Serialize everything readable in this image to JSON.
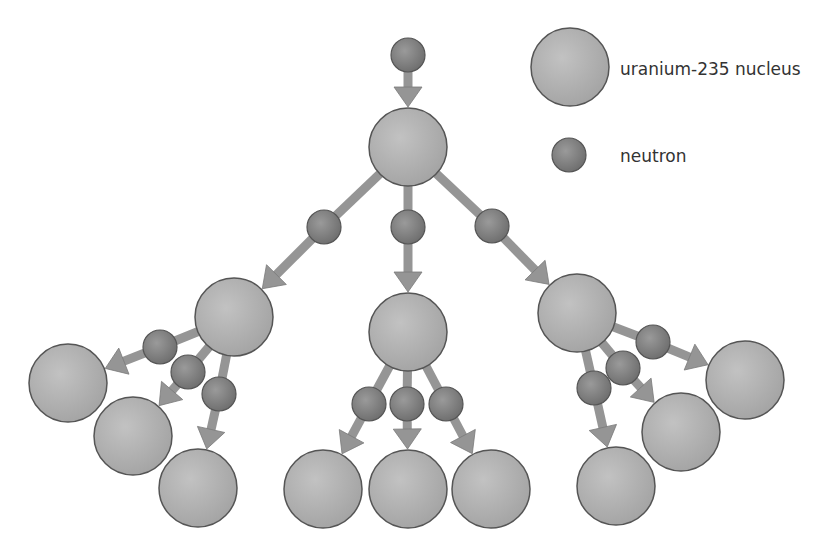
{
  "diagram": {
    "colors": {
      "nucleus_fill": "#a4a4a4",
      "nucleus_highlight": "#c2c2c2",
      "neutron_fill": "#7e7e7e",
      "neutron_highlight": "#9a9a9a",
      "stroke": "#555555",
      "arrow": "#959595"
    },
    "nucleus_radius": 39,
    "neutron_radius": 17,
    "nuclei": [
      {
        "id": "n0",
        "x": 408,
        "y": 147
      },
      {
        "id": "n1a",
        "x": 234,
        "y": 317
      },
      {
        "id": "n1b",
        "x": 408,
        "y": 332
      },
      {
        "id": "n1c",
        "x": 577,
        "y": 313
      },
      {
        "id": "n2a",
        "x": 68,
        "y": 383
      },
      {
        "id": "n2b",
        "x": 133,
        "y": 436
      },
      {
        "id": "n2c",
        "x": 198,
        "y": 488
      },
      {
        "id": "n2d",
        "x": 323,
        "y": 489
      },
      {
        "id": "n2e",
        "x": 408,
        "y": 489
      },
      {
        "id": "n2f",
        "x": 491,
        "y": 489
      },
      {
        "id": "n2g",
        "x": 616,
        "y": 486
      },
      {
        "id": "n2h",
        "x": 681,
        "y": 432
      },
      {
        "id": "n2i",
        "x": 745,
        "y": 380
      }
    ],
    "neutrons": [
      {
        "from": null,
        "x": 408,
        "y": 55,
        "to": "n0"
      },
      {
        "from": "n0",
        "x": 324,
        "y": 227,
        "to": "n1a"
      },
      {
        "from": "n0",
        "x": 408,
        "y": 227,
        "to": "n1b"
      },
      {
        "from": "n0",
        "x": 492,
        "y": 226,
        "to": "n1c"
      },
      {
        "from": "n1a",
        "x": 160,
        "y": 347,
        "to": "n2a"
      },
      {
        "from": "n1a",
        "x": 188,
        "y": 372,
        "to": "n2b"
      },
      {
        "from": "n1a",
        "x": 219,
        "y": 394,
        "to": "n2c"
      },
      {
        "from": "n1b",
        "x": 369,
        "y": 404,
        "to": "n2d"
      },
      {
        "from": "n1b",
        "x": 407,
        "y": 404,
        "to": "n2e"
      },
      {
        "from": "n1b",
        "x": 446,
        "y": 404,
        "to": "n2f"
      },
      {
        "from": "n1c",
        "x": 594,
        "y": 388,
        "to": "n2g"
      },
      {
        "from": "n1c",
        "x": 623,
        "y": 368,
        "to": "n2h"
      },
      {
        "from": "n1c",
        "x": 653,
        "y": 342,
        "to": "n2i"
      }
    ]
  },
  "legend": {
    "nucleus": {
      "label": "uranium-235 nucleus",
      "x": 570,
      "y": 67
    },
    "neutron": {
      "label": "neutron",
      "x": 569,
      "y": 155
    }
  }
}
